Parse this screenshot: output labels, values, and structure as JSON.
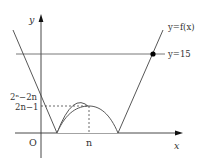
{
  "figure": {
    "type": "function-graph",
    "axes": {
      "x_label": "x",
      "y_label": "y",
      "origin_label": "O"
    },
    "curve_label": "y=f(x)",
    "horizontal_line_label": "y=15",
    "y_tick_labels": {
      "upper": "2ⁿ−2n",
      "lower": "2n−1"
    },
    "x_tick_labels": {
      "n": "n"
    },
    "colors": {
      "line": "#444444",
      "axis": "#333333",
      "dot": "#000000",
      "text": "#333333"
    }
  }
}
